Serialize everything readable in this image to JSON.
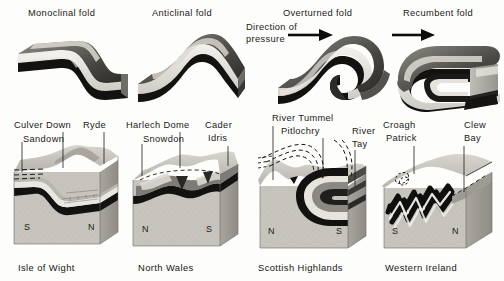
{
  "figure": {
    "title_row": {
      "folds": [
        {
          "id": "monoclinal",
          "label": "Monoclinal fold",
          "x": 28,
          "y": 8
        },
        {
          "id": "anticlinal",
          "label": "Anticlinal fold",
          "x": 152,
          "y": 8
        },
        {
          "id": "overturned",
          "label": "Overturned fold",
          "x": 283,
          "y": 8
        },
        {
          "id": "recumbent",
          "label": "Recumbent fold",
          "x": 403,
          "y": 8
        }
      ],
      "pressure_note": {
        "line1": "Direction of",
        "line2": "pressure",
        "x": 246,
        "y": 22
      }
    },
    "blocks": [
      {
        "id": "isle-of-wight",
        "caption": "Isle of Wight",
        "caption_x": 18,
        "caption_y": 262,
        "left_marker": "S",
        "right_marker": "N",
        "labels": [
          {
            "text": "Culver Down",
            "x": 14,
            "y": 120,
            "leader_x": 63,
            "leader_y0": 132,
            "leader_y1": 168
          },
          {
            "text": "Ryde",
            "x": 83,
            "y": 120,
            "leader_x": 104,
            "leader_y0": 132,
            "leader_y1": 163
          },
          {
            "text": "Sandown",
            "x": 23,
            "y": 134,
            "leader_x": 22,
            "leader_y0": 132,
            "leader_y1": 172
          }
        ]
      },
      {
        "id": "north-wales",
        "caption": "North Wales",
        "caption_x": 138,
        "caption_y": 262,
        "left_marker": "N",
        "right_marker": "S",
        "labels": [
          {
            "text": "Harlech Dome",
            "x": 126,
            "y": 120,
            "leader_x": 180,
            "leader_y0": 132,
            "leader_y1": 166
          },
          {
            "text": "Cader",
            "x": 205,
            "y": 120,
            "leader_x": 228,
            "leader_y0": 132,
            "leader_y1": 164
          },
          {
            "text": "Idris",
            "x": 208,
            "y": 133,
            "leader_x": 228,
            "leader_y0": 132,
            "leader_y1": 164
          },
          {
            "text": "Snowdon",
            "x": 143,
            "y": 134,
            "leader_x": 142,
            "leader_y0": 132,
            "leader_y1": 168
          }
        ]
      },
      {
        "id": "scottish-highlands",
        "caption": "Scottish Highlands",
        "caption_x": 258,
        "caption_y": 262,
        "left_marker": "N",
        "right_marker": "S",
        "labels": [
          {
            "text": "River Tummel",
            "x": 272,
            "y": 113,
            "leader_x": 273,
            "leader_y0": 126,
            "leader_y1": 180
          },
          {
            "text": "Pitlochry",
            "x": 281,
            "y": 126,
            "leader_x": 323,
            "leader_y0": 138,
            "leader_y1": 178
          },
          {
            "text": "River",
            "x": 352,
            "y": 126,
            "leader_x": 355,
            "leader_y0": 138,
            "leader_y1": 185
          },
          {
            "text": "Tay",
            "x": 352,
            "y": 139,
            "leader_x": 355,
            "leader_y0": 138,
            "leader_y1": 185
          }
        ]
      },
      {
        "id": "western-ireland",
        "caption": "Western Ireland",
        "caption_x": 385,
        "caption_y": 262,
        "left_marker": "S",
        "right_marker": "N",
        "labels": [
          {
            "text": "Croagh",
            "x": 383,
            "y": 120,
            "leader_x": 414,
            "leader_y0": 132,
            "leader_y1": 170
          },
          {
            "text": "Patrick",
            "x": 386,
            "y": 133,
            "leader_x": 414,
            "leader_y0": 132,
            "leader_y1": 170
          },
          {
            "text": "Clew",
            "x": 464,
            "y": 120,
            "leader_x": 464,
            "leader_y0": 132,
            "leader_y1": 180
          },
          {
            "text": "Bay",
            "x": 464,
            "y": 133,
            "leader_x": 464,
            "leader_y0": 132,
            "leader_y1": 180
          }
        ]
      }
    ],
    "colors": {
      "paper": "#fdfdfb",
      "ink": "#1a1a1a",
      "stratum_dark": "#111111",
      "stratum_light": "#e8e6e0",
      "stratum_mid": "#9b9891",
      "rock_body": "#c8c6c0",
      "rock_side": "#a9a6a0",
      "rock_top": "#b5b2ab"
    }
  }
}
